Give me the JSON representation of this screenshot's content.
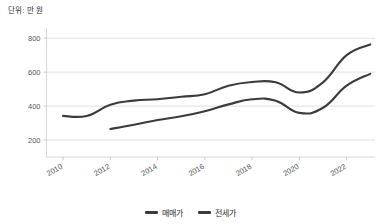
{
  "unit_note": "단위: 만 원",
  "legend": {
    "items": [
      {
        "label": "매매가",
        "color": "#3b3b3b",
        "swatch_name": "legend-swatch-maemae"
      },
      {
        "label": "전세가",
        "color": "#3b3b3b",
        "swatch_name": "legend-swatch-jeonse"
      }
    ]
  },
  "axes": {
    "y_ticks": [
      "200",
      "400",
      "600",
      "800"
    ],
    "x_ticks": [
      "2010",
      "2012",
      "2014",
      "2016",
      "2018",
      "2020",
      "2022"
    ]
  },
  "chart_data": {
    "type": "line",
    "title": "",
    "subtitle": "",
    "xlabel": "",
    "ylabel": "단위: 만 원",
    "xlim": [
      2009.3,
      2023.2
    ],
    "ylim": [
      100,
      860
    ],
    "yticks": [
      200,
      400,
      600,
      800
    ],
    "xticks": [
      2010,
      2012,
      2014,
      2016,
      2018,
      2020,
      2022
    ],
    "grid": true,
    "legend_position": "bottom-center",
    "x": [
      2010,
      2011,
      2012,
      2013,
      2014,
      2015,
      2016,
      2017,
      2018,
      2019,
      2020,
      2021,
      2022,
      2023
    ],
    "series": [
      {
        "name": "매매가",
        "color": "#3b3b3b",
        "values": [
          342,
          342,
          408,
          432,
          440,
          455,
          470,
          520,
          542,
          540,
          480,
          540,
          700,
          763
        ]
      },
      {
        "name": "전세가",
        "color": "#3b3b3b",
        "values": [
          null,
          null,
          265,
          290,
          318,
          340,
          370,
          410,
          440,
          432,
          360,
          390,
          520,
          590
        ]
      }
    ]
  }
}
